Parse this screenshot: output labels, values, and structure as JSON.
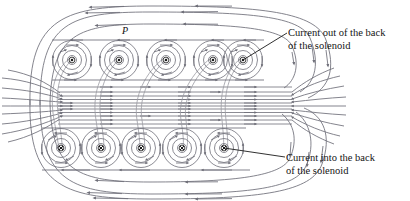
{
  "figure": {
    "kind": "physics-diagram",
    "background_color": "#ffffff",
    "field_line_color": "#6e6e78",
    "wire_color": "#8a8a92",
    "text_color": "#141414",
    "point_label": "P",
    "point_marker": "filled-dot"
  },
  "annotations": {
    "current_out": {
      "line1": "Current out of the back",
      "line2": "of the solenoid",
      "leader_from": [
        288,
        34
      ],
      "leader_to": [
        243,
        60
      ]
    },
    "current_in": {
      "line1": "Current into the back",
      "line2": "of the solenoid",
      "leader_from": [
        286,
        158
      ],
      "leader_to": [
        224,
        148
      ]
    }
  },
  "coils": {
    "symbol_out": "dot-in-circle",
    "symbol_in": "cross-in-circle",
    "top_row": {
      "y": 60,
      "centers_x": [
        72,
        119,
        166,
        213,
        243
      ],
      "symbol": "dot-in-circle",
      "count": 5
    },
    "bottom_row": {
      "y": 148,
      "centers_x": [
        61,
        101,
        141,
        182,
        224
      ],
      "symbol": "cross-in-circle",
      "count": 5
    },
    "ring_radii": [
      4,
      9,
      14,
      19
    ]
  },
  "field": {
    "interior_lines": 11,
    "interior_arrow_direction": "right",
    "exterior_arrow_direction": "left",
    "outer_loops": 3
  }
}
